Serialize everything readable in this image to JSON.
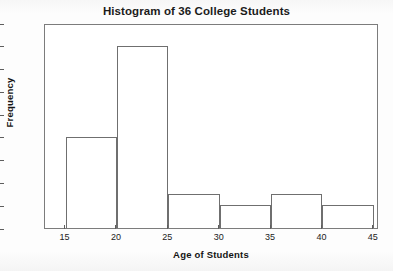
{
  "chart_data": {
    "type": "bar",
    "title": "Histogram of 36 College Students",
    "xlabel": "Age of Students",
    "ylabel": "Frequency",
    "categories": [
      "15-20",
      "20-25",
      "25-30",
      "30-35",
      "35-40",
      "40-45"
    ],
    "bin_edges": [
      15,
      20,
      25,
      30,
      35,
      40,
      45
    ],
    "values": [
      8,
      16,
      3,
      2,
      3,
      2
    ],
    "bins": [
      {
        "label": "15-20",
        "start": 15,
        "end": 20,
        "frequency": 8
      },
      {
        "label": "20-25",
        "start": 20,
        "end": 25,
        "frequency": 16
      },
      {
        "label": "25-30",
        "start": 25,
        "end": 30,
        "frequency": 3
      },
      {
        "label": "30-35",
        "start": 30,
        "end": 35,
        "frequency": 2
      },
      {
        "label": "35-40",
        "start": 35,
        "end": 40,
        "frequency": 3
      },
      {
        "label": "40-45",
        "start": 40,
        "end": 45,
        "frequency": 2
      }
    ],
    "xlim": [
      13,
      45.5
    ],
    "ylim": [
      0,
      18
    ],
    "xticks": [
      15,
      20,
      25,
      30,
      35,
      40,
      45
    ],
    "yticks": [
      0,
      2,
      4,
      6,
      8,
      10,
      12,
      14,
      16,
      18
    ],
    "grid": false,
    "legend": false,
    "bar_fill_color": "#ffffff",
    "bar_edge_color": "#6f6f6f",
    "axis_color": "#7c7c7c",
    "text_color": "#1b1b1b",
    "background_color": "#ffffff"
  }
}
